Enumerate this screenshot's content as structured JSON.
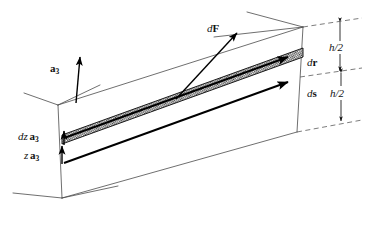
{
  "figure": {
    "domain": "diagram",
    "background_color": "#ffffff",
    "ink_color": "#111111",
    "line_color": "#4a4a4a",
    "hatch_color": "#3a3a3a",
    "width": 372,
    "height": 229
  },
  "labels": {
    "basis_vector": {
      "text": "a",
      "subscript": "3",
      "name": "a3-basis-vector-label"
    },
    "force": {
      "prefix": "d",
      "symbol": "F",
      "name": "dF-force-label"
    },
    "dr": {
      "prefix": "d",
      "symbol": "r",
      "name": "dr-label"
    },
    "ds": {
      "prefix": "d",
      "symbol": "s",
      "name": "ds-label"
    },
    "dz_a3": {
      "prefix": "dz",
      "symbol": "a",
      "subscript": "3",
      "name": "dz-a3-label"
    },
    "z_a3": {
      "prefix": "z",
      "symbol": "a",
      "subscript": "3",
      "name": "z-a3-label"
    },
    "dim_upper": {
      "text": "h/2",
      "name": "upper-half-height-label"
    },
    "dim_lower": {
      "text": "h/2",
      "name": "lower-half-height-label"
    }
  },
  "geometry": {
    "box_front_top_left": [
      58,
      105
    ],
    "box_front_top_right": [
      303,
      27
    ],
    "box_front_bottom_left": [
      62,
      198
    ],
    "box_front_bottom_right": [
      297,
      132
    ],
    "hatched_band": "shaded differential lamina of thickness dz located at height z above mid-surface",
    "dimension_lines": "two stacked h/2 dimensions on the right face, separated by the mid-surface dashed datum"
  }
}
